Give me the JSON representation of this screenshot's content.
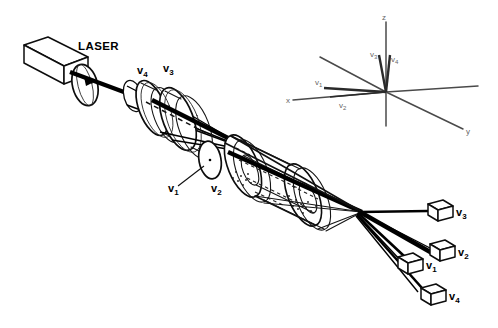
{
  "figure": {
    "background_color": "#ffffff",
    "ink_color": "#101010",
    "axis_color": "#4a4a4a"
  },
  "source": {
    "label": "LASER",
    "kind": "laser-source-box"
  },
  "optics": {
    "beamsplitter_label": "",
    "lens_group_labels": [
      "v4",
      "v3"
    ],
    "lens_v4_label": "v",
    "lens_v4_sub": "4",
    "lens_v3_label": "v",
    "lens_v3_sub": "3",
    "pinhole_label": "v",
    "pinhole_sub": "1",
    "cell_label": "v",
    "cell_sub": "2"
  },
  "detectors": [
    {
      "id": "detector-v3",
      "label": "v",
      "sub": "3"
    },
    {
      "id": "detector-v2",
      "label": "v",
      "sub": "2"
    },
    {
      "id": "detector-v1",
      "label": "v",
      "sub": "1"
    },
    {
      "id": "detector-v4",
      "label": "v",
      "sub": "4"
    }
  ],
  "coordinate_system": {
    "axes": [
      {
        "id": "axis-z",
        "label": "z"
      },
      {
        "id": "axis-x",
        "label": "x"
      },
      {
        "id": "axis-y",
        "label": "y"
      }
    ],
    "vectors": [
      {
        "id": "vector-v3",
        "label": "v",
        "sub": "3"
      },
      {
        "id": "vector-v4",
        "label": "v",
        "sub": "4"
      },
      {
        "id": "vector-v1",
        "label": "v",
        "sub": "1"
      },
      {
        "id": "vector-v2",
        "label": "v",
        "sub": "2"
      }
    ]
  }
}
